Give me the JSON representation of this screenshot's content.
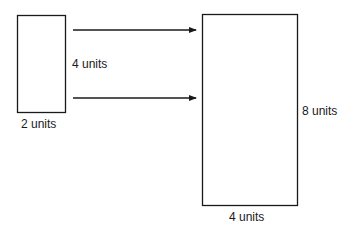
{
  "diagram": {
    "small_rectangle": {
      "width_label": "2 units",
      "height_label": "4 units"
    },
    "large_rectangle": {
      "width_label": "4 units",
      "height_label": "8 units"
    },
    "arrows": [
      {
        "from": "small_rectangle",
        "to": "large_rectangle",
        "position": "upper"
      },
      {
        "from": "small_rectangle",
        "to": "large_rectangle",
        "position": "lower"
      }
    ],
    "colors": {
      "stroke": "#1a1a1a",
      "background": "#ffffff"
    }
  }
}
